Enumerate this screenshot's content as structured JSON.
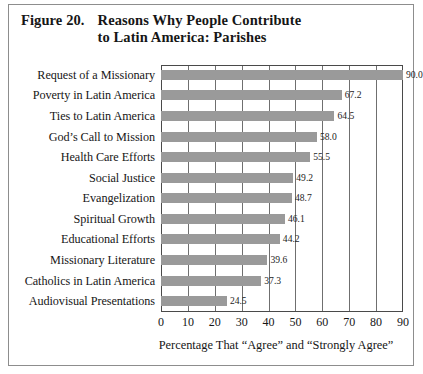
{
  "figure": {
    "number": "Figure 20.",
    "title_line1": "Reasons Why People Contribute",
    "title_line2": "to Latin America: Parishes"
  },
  "colors": {
    "bar": "#9a9a9a",
    "axis": "#4a4a4a",
    "grid": "#6f6f6f",
    "frame": "#8d8d8d",
    "text": "#161616"
  },
  "chart_data": {
    "type": "bar",
    "orientation": "horizontal",
    "title": "Figure 20.  Reasons Why People Contribute to Latin America: Parishes",
    "xlabel": "Percentage That “Agree” and “Strongly Agree”",
    "ylabel": "",
    "xlim": [
      0,
      90
    ],
    "xticks": [
      0,
      10,
      20,
      30,
      40,
      50,
      60,
      70,
      80,
      90
    ],
    "xtick_labels": [
      "0",
      "10",
      "20",
      "30",
      "40",
      "50",
      "60",
      "70",
      "80",
      "90"
    ],
    "grid": true,
    "legend": false,
    "categories": [
      "Request of a Missionary",
      "Poverty in Latin America",
      "Ties to Latin America",
      "God’s Call to Mission",
      "Health Care Efforts",
      "Social Justice",
      "Evangelization",
      "Spiritual Growth",
      "Educational Efforts",
      "Missionary Literature",
      "Catholics in Latin America",
      "Audiovisual Presentations"
    ],
    "values": [
      90.0,
      67.2,
      64.5,
      58.0,
      55.5,
      49.2,
      48.7,
      46.1,
      44.2,
      39.6,
      37.3,
      24.5
    ],
    "value_labels": [
      "90.0",
      "67.2",
      "64.5",
      "58.0",
      "55.5",
      "49.2",
      "48.7",
      "46.1",
      "44.2",
      "39.6",
      "37.3",
      "24.5"
    ]
  }
}
